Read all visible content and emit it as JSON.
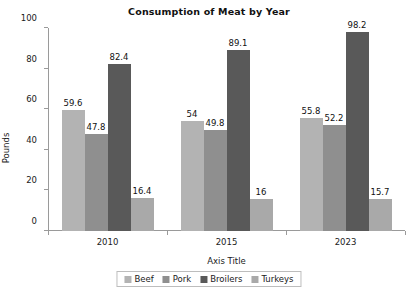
{
  "chart_data": {
    "type": "bar",
    "title": "Consumption of Meat by Year",
    "xlabel": "Axis Title",
    "ylabel": "Pounds",
    "ylim": [
      0,
      100
    ],
    "yticks": [
      0,
      20,
      40,
      60,
      80,
      100
    ],
    "grid": false,
    "legend_position": "bottom",
    "categories": [
      "2010",
      "2015",
      "2023"
    ],
    "series": [
      {
        "name": "Beef",
        "color": "#b3b3b3",
        "values": [
          59.6,
          54,
          55.8
        ],
        "labels": [
          "59.6",
          "54",
          "55.8"
        ]
      },
      {
        "name": "Pork",
        "color": "#8f8f8f",
        "values": [
          47.8,
          49.8,
          52.2
        ],
        "labels": [
          "47.8",
          "49.8",
          "52.2"
        ]
      },
      {
        "name": "Broilers",
        "color": "#595959",
        "values": [
          82.4,
          89.1,
          98.2
        ],
        "labels": [
          "82.4",
          "89.1",
          "98.2"
        ]
      },
      {
        "name": "Turkeys",
        "color": "#a9a9a9",
        "values": [
          16.4,
          16,
          15.7
        ],
        "labels": [
          "16.4",
          "16",
          "15.7"
        ]
      }
    ]
  }
}
